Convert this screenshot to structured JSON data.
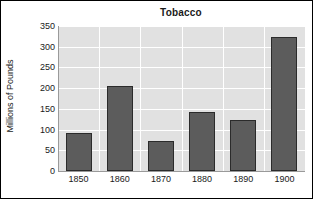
{
  "chart_data": {
    "type": "bar",
    "title": "Tobacco",
    "xlabel": "",
    "ylabel": "Millions of Pounds",
    "categories": [
      "1850",
      "1860",
      "1870",
      "1880",
      "1890",
      "1900"
    ],
    "values": [
      92,
      205,
      72,
      143,
      123,
      324
    ],
    "ylim": [
      0,
      350
    ],
    "ytick_labels": [
      "350",
      "300",
      "250",
      "200",
      "150",
      "100",
      "50",
      "0"
    ],
    "ytick_values": [
      350,
      300,
      250,
      200,
      150,
      100,
      50,
      0
    ],
    "ytick_step": 50,
    "grid": "horizontal-and-vertical",
    "legend": "none",
    "series": [
      {
        "name": "Tobacco production",
        "values": [
          92,
          205,
          72,
          143,
          123,
          324
        ]
      }
    ],
    "colors": {
      "bar_fill": "#5c5c5c",
      "bar_edge": "#2b2b2b",
      "plot_background": "#e1e1e1",
      "gridline": "#ffffff",
      "figure_background": "#ffffff",
      "frame": "#000000",
      "text": "#1a1a1a"
    }
  }
}
